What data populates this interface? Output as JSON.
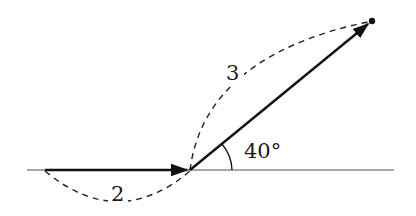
{
  "diagram": {
    "type": "vector-path",
    "baseline": {
      "x1": 27,
      "x2": 394,
      "y": 170,
      "color": "#888888"
    },
    "vectors": [
      {
        "name": "first-displacement",
        "from": [
          45,
          170
        ],
        "to": [
          190,
          170
        ],
        "length_label": "2"
      },
      {
        "name": "second-displacement",
        "from": [
          190,
          170
        ],
        "to": [
          372,
          21
        ],
        "length_label": "3"
      }
    ],
    "angle": {
      "label": "40°",
      "vertex": [
        190,
        170
      ]
    },
    "endpoint": [
      372,
      21
    ],
    "labels": {
      "length_first": "2",
      "length_second": "3",
      "angle": "40°"
    }
  }
}
